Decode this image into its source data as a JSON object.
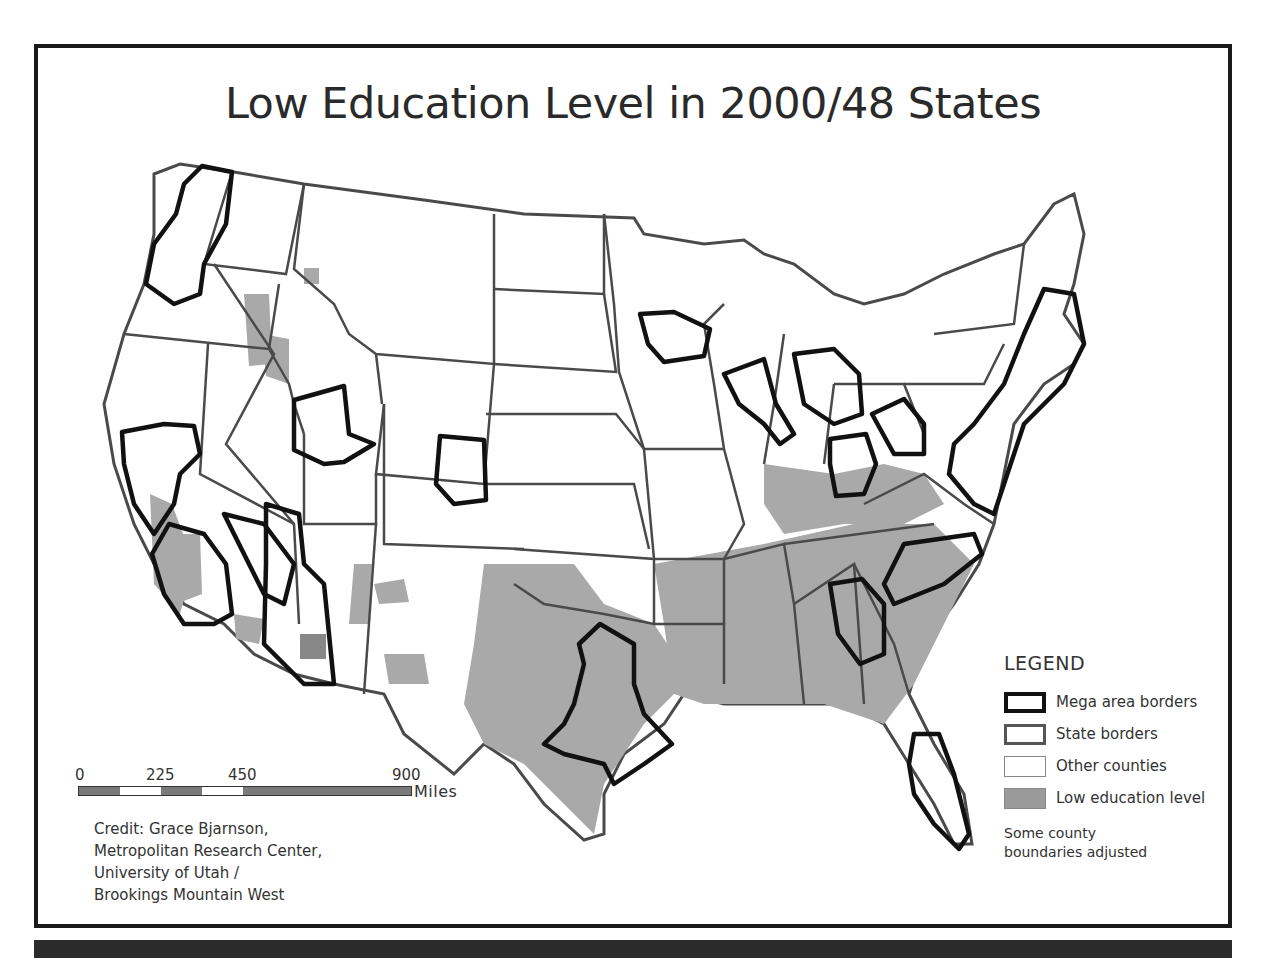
{
  "map": {
    "title": "Low Education Level in 2000/48 States",
    "legend": {
      "title": "LEGEND",
      "items": [
        {
          "key": "mega",
          "label": "Mega area borders"
        },
        {
          "key": "state",
          "label": "State borders"
        },
        {
          "key": "other",
          "label": "Other counties"
        },
        {
          "key": "low",
          "label": "Low education level"
        }
      ],
      "note": "Some county boundaries adjusted"
    },
    "scale_bar": {
      "ticks": [
        "0",
        "225",
        "450",
        "900"
      ],
      "unit": "Miles"
    },
    "credit": [
      "Credit: Grace Bjarnson,",
      "Metropolitan Research Center,",
      "University of Utah /",
      "Brookings Mountain West"
    ],
    "colors": {
      "frame": "#1a1a1a",
      "mega_border": "#111111",
      "state_border": "#4a4a4a",
      "county_border": "#999999",
      "low_education_fill": "#a0a0a0",
      "other_county_fill": "#ffffff",
      "bottom_strip": "#2b2b2b"
    },
    "mega_areas": [
      "Cascadia",
      "Northern California",
      "Southern California",
      "Las Vegas",
      "Wasatch Front",
      "Front Range",
      "Arizona Sun Corridor",
      "Texas Triangle",
      "Twin Cities",
      "Chicago",
      "Detroit",
      "Ohio",
      "Pittsburgh",
      "Northeast Corridor",
      "Atlanta",
      "Piedmont",
      "Florida"
    ]
  }
}
